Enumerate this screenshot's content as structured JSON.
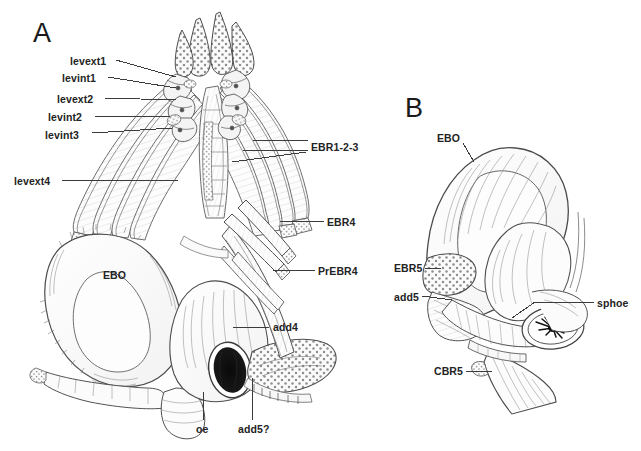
{
  "figure": {
    "background_color": "#ffffff",
    "ink_color": "#3b3b3b",
    "label_color": "#232323",
    "stipple_color": "#8c8c8c",
    "width": 641,
    "height": 451
  },
  "panels": [
    {
      "id": "A",
      "letter": "A",
      "letter_pos": {
        "x": 33,
        "y": 20
      },
      "description": "Dorsal view of branchial basket with levator muscles, epibranchials and esophagus"
    },
    {
      "id": "B",
      "letter": "B",
      "letter_pos": {
        "x": 405,
        "y": 95
      },
      "description": "Lateral view showing EBO, fifth epibranchial, adductor and ceratobranchial 5"
    }
  ],
  "annotations": [
    {
      "id": "levext1",
      "label": "levext1",
      "panel": "A",
      "text_x": 70,
      "text_y": 56,
      "anchor": "end",
      "leader": {
        "x1": 116,
        "y1": 60,
        "x2": 176,
        "y2": 77
      }
    },
    {
      "id": "levint1",
      "label": "levint1",
      "panel": "A",
      "text_x": 62,
      "text_y": 73,
      "anchor": "end",
      "leader": {
        "x1": 108,
        "y1": 77,
        "x2": 176,
        "y2": 88
      }
    },
    {
      "id": "levext2",
      "label": "levext2",
      "panel": "A",
      "text_x": 57,
      "text_y": 94,
      "anchor": "end",
      "leader": {
        "x1": 104,
        "y1": 98,
        "x2": 176,
        "y2": 100
      }
    },
    {
      "id": "levint2",
      "label": "levint2",
      "panel": "A",
      "text_x": 48,
      "text_y": 112,
      "anchor": "end",
      "leader": {
        "x1": 95,
        "y1": 116,
        "x2": 170,
        "y2": 116
      }
    },
    {
      "id": "levint3",
      "label": "levint3",
      "panel": "A",
      "text_x": 45,
      "text_y": 130,
      "anchor": "end",
      "leader": {
        "x1": 92,
        "y1": 133,
        "x2": 172,
        "y2": 128
      }
    },
    {
      "id": "levext4",
      "label": "levext4",
      "panel": "A",
      "text_x": 14,
      "text_y": 176,
      "anchor": "end",
      "leader": {
        "x1": 62,
        "y1": 180,
        "x2": 178,
        "y2": 180
      }
    },
    {
      "id": "EBR1-2-3",
      "label": "EBR1-2-3",
      "panel": "A",
      "text_x": 311,
      "text_y": 142,
      "anchor": "start",
      "leader": {
        "x1": 258,
        "y1": 146,
        "x2": 308,
        "y2": 146
      }
    },
    {
      "id": "EBR4",
      "label": "EBR4",
      "panel": "A",
      "text_x": 327,
      "text_y": 217,
      "anchor": "start",
      "leader": {
        "x1": 280,
        "y1": 221,
        "x2": 324,
        "y2": 221
      }
    },
    {
      "id": "PrEBR4",
      "label": "PrEBR4",
      "panel": "A",
      "text_x": 318,
      "text_y": 266,
      "anchor": "start",
      "leader": {
        "x1": 273,
        "y1": 270,
        "x2": 315,
        "y2": 270
      }
    },
    {
      "id": "EBO-A",
      "label": "EBO",
      "panel": "A",
      "text_x": 103,
      "text_y": 270,
      "anchor": "start",
      "leader": null
    },
    {
      "id": "add4",
      "label": "add4",
      "panel": "A",
      "text_x": 273,
      "text_y": 322,
      "anchor": "start",
      "leader": {
        "x1": 233,
        "y1": 327,
        "x2": 269,
        "y2": 327
      }
    },
    {
      "id": "oe",
      "label": "oe",
      "panel": "A",
      "text_x": 196,
      "text_y": 424,
      "anchor": "start",
      "leader": {
        "x1": 203,
        "y1": 392,
        "x2": 203,
        "y2": 420
      }
    },
    {
      "id": "add5q",
      "label": "add5?",
      "panel": "A",
      "text_x": 238,
      "text_y": 424,
      "anchor": "start",
      "leader": {
        "x1": 252,
        "y1": 378,
        "x2": 252,
        "y2": 420
      }
    },
    {
      "id": "EBO-B",
      "label": "EBO",
      "panel": "B",
      "text_x": 437,
      "text_y": 133,
      "anchor": "start",
      "leader": {
        "x1": 463,
        "y1": 143,
        "x2": 474,
        "y2": 162
      }
    },
    {
      "id": "EBR5",
      "label": "EBR5",
      "panel": "B",
      "text_x": 394,
      "text_y": 263,
      "anchor": "start",
      "leader": {
        "x1": 425,
        "y1": 268,
        "x2": 441,
        "y2": 268
      }
    },
    {
      "id": "add5",
      "label": "add5",
      "panel": "B",
      "text_x": 394,
      "text_y": 292,
      "anchor": "start",
      "leader": {
        "x1": 422,
        "y1": 296,
        "x2": 452,
        "y2": 300
      }
    },
    {
      "id": "CBR5",
      "label": "CBR5",
      "panel": "B",
      "text_x": 434,
      "text_y": 366,
      "anchor": "start",
      "leader": {
        "x1": 466,
        "y1": 371,
        "x2": 492,
        "y2": 371
      }
    },
    {
      "id": "sphoe",
      "label": "sphoe",
      "panel": "B",
      "text_x": 597,
      "text_y": 298,
      "anchor": "start",
      "leader": {
        "x1": 535,
        "y1": 302,
        "x2": 594,
        "y2": 302
      }
    }
  ]
}
